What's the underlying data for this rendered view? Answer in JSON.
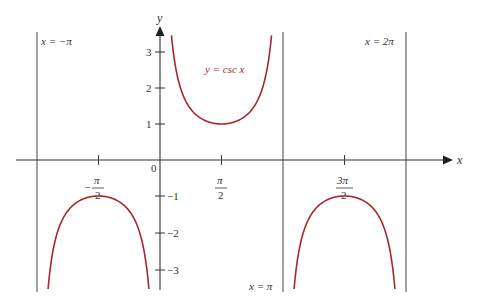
{
  "chart_data": {
    "type": "line",
    "title": "",
    "function_label": "y = csc x",
    "xlabel": "x",
    "ylabel": "y",
    "xlim": [
      -3.5,
      4.75
    ],
    "ylim": [
      -3.6,
      3.6
    ],
    "grid": false,
    "legend": null,
    "x_ticks": [
      {
        "value": -1.5708,
        "label_num": "π",
        "label_den": "2",
        "sign": "−"
      },
      {
        "value": 1.5708,
        "label_num": "π",
        "label_den": "2",
        "sign": ""
      },
      {
        "value": 4.7124,
        "label_num": "3π",
        "label_den": "2",
        "sign": ""
      }
    ],
    "origin_label": "0",
    "y_ticks": [
      {
        "value": 3,
        "label": "3"
      },
      {
        "value": 2,
        "label": "2"
      },
      {
        "value": 1,
        "label": "1"
      },
      {
        "value": -1,
        "label": "−1"
      },
      {
        "value": -2,
        "label": "−2"
      },
      {
        "value": -3,
        "label": "−3"
      }
    ],
    "asymptotes": [
      {
        "x": -3.1416,
        "label": "x = −π"
      },
      {
        "x": 3.1416,
        "label": "x = π"
      },
      {
        "x": 6.2832,
        "label": "x = 2π"
      }
    ],
    "series": [
      {
        "name": "y = csc x",
        "color": "#a8282c",
        "branches": [
          {
            "x_range": [
              -3.1416,
              0
            ],
            "min_or_max": {
              "x": -1.5708,
              "y": -1
            }
          },
          {
            "x_range": [
              0,
              3.1416
            ],
            "min_or_max": {
              "x": 1.5708,
              "y": 1
            }
          },
          {
            "x_range": [
              3.1416,
              6.2832
            ],
            "min_or_max": {
              "x": 4.7124,
              "y": -1
            }
          }
        ]
      }
    ],
    "annotations": [
      "x = −π",
      "x = 2π",
      "x = π",
      "y = csc x"
    ]
  },
  "colors": {
    "curve": "#a8282c",
    "axis": "#333333",
    "asymptote": "#555555"
  }
}
